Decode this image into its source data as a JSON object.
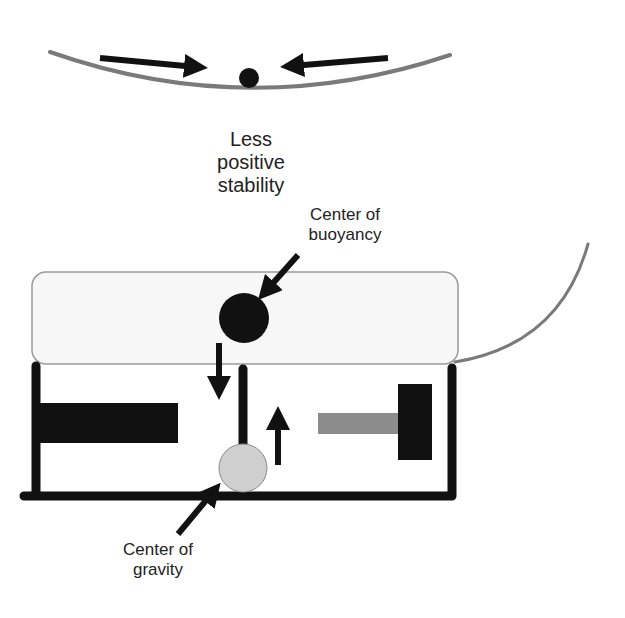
{
  "diagram": {
    "title_lines": [
      "Less",
      "positive",
      "stability"
    ],
    "labels": {
      "center_of_buoyancy": [
        "Center of",
        "buoyancy"
      ],
      "center_of_gravity": [
        "Center of",
        "gravity"
      ]
    },
    "colors": {
      "dark": "#111111",
      "curve_gray": "#7a7a7a",
      "pontoon_fill": "#f7f7f7",
      "pontoon_stroke": "#9a9a9a",
      "gravity_fill": "#cfcfcf",
      "weight_gray": "#8c8c8c"
    }
  }
}
